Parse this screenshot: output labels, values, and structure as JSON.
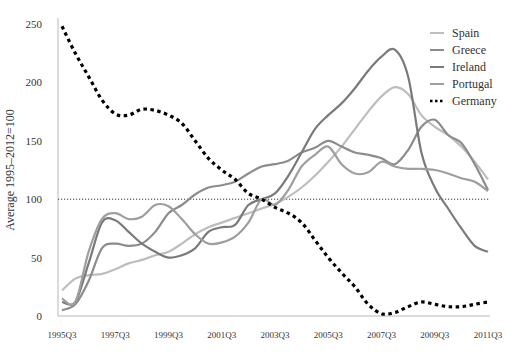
{
  "chart_data": {
    "type": "line",
    "title": "",
    "xlabel": "",
    "ylabel": "Average 1995–2012=100",
    "ylim": [
      0,
      250
    ],
    "yticks": [
      0,
      50,
      100,
      150,
      200,
      250
    ],
    "xticks": [
      "1995Q3",
      "1997Q3",
      "1999Q3",
      "2001Q3",
      "2003Q3",
      "2005Q3",
      "2007Q3",
      "2009Q3",
      "2011Q3"
    ],
    "x": [
      1995.5,
      1996.0,
      1996.5,
      1997.0,
      1997.5,
      1998.0,
      1998.5,
      1999.0,
      1999.5,
      2000.0,
      2000.5,
      2001.0,
      2001.5,
      2002.0,
      2002.5,
      2003.0,
      2003.5,
      2004.0,
      2004.5,
      2005.0,
      2005.5,
      2006.0,
      2006.5,
      2007.0,
      2007.5,
      2008.0,
      2008.5,
      2009.0,
      2009.5,
      2010.0,
      2010.5,
      2011.0,
      2011.5
    ],
    "xlim": [
      1995.5,
      2011.5
    ],
    "reference_line": {
      "value": 100,
      "style": "dotted"
    },
    "grid": false,
    "legend_position": "top-right",
    "series": [
      {
        "name": "Spain",
        "style": "solid",
        "color": "#bdbdbd",
        "values": [
          22,
          32,
          35,
          36,
          40,
          45,
          48,
          52,
          55,
          62,
          70,
          76,
          80,
          84,
          88,
          92,
          96,
          102,
          110,
          120,
          132,
          145,
          160,
          175,
          188,
          196,
          190,
          172,
          162,
          155,
          145,
          132,
          117
        ]
      },
      {
        "name": "Greece",
        "style": "solid",
        "color": "#8c8c8c",
        "values": [
          5,
          10,
          30,
          58,
          62,
          60,
          62,
          72,
          88,
          95,
          104,
          110,
          112,
          115,
          122,
          128,
          130,
          133,
          140,
          144,
          150,
          145,
          140,
          138,
          135,
          130,
          142,
          162,
          168,
          155,
          148,
          130,
          108
        ]
      },
      {
        "name": "Ireland",
        "style": "solid",
        "color": "#7a7a7a",
        "values": [
          12,
          12,
          45,
          80,
          82,
          72,
          62,
          55,
          50,
          52,
          58,
          72,
          76,
          78,
          95,
          100,
          105,
          120,
          140,
          160,
          172,
          182,
          195,
          210,
          222,
          228,
          205,
          140,
          110,
          92,
          75,
          60,
          55
        ]
      },
      {
        "name": "Portugal",
        "style": "solid",
        "color": "#9e9e9e",
        "values": [
          15,
          12,
          55,
          83,
          88,
          83,
          85,
          95,
          94,
          83,
          70,
          62,
          63,
          68,
          80,
          100,
          95,
          108,
          128,
          138,
          145,
          130,
          122,
          123,
          132,
          128,
          126,
          126,
          125,
          122,
          118,
          115,
          107
        ]
      },
      {
        "name": "Germany",
        "style": "dashed",
        "color": "#000000",
        "values": [
          248,
          225,
          205,
          185,
          173,
          172,
          177,
          176,
          172,
          165,
          150,
          135,
          125,
          117,
          105,
          100,
          93,
          88,
          80,
          65,
          50,
          37,
          25,
          10,
          2,
          3,
          8,
          12,
          10,
          8,
          8,
          10,
          12
        ]
      }
    ]
  }
}
